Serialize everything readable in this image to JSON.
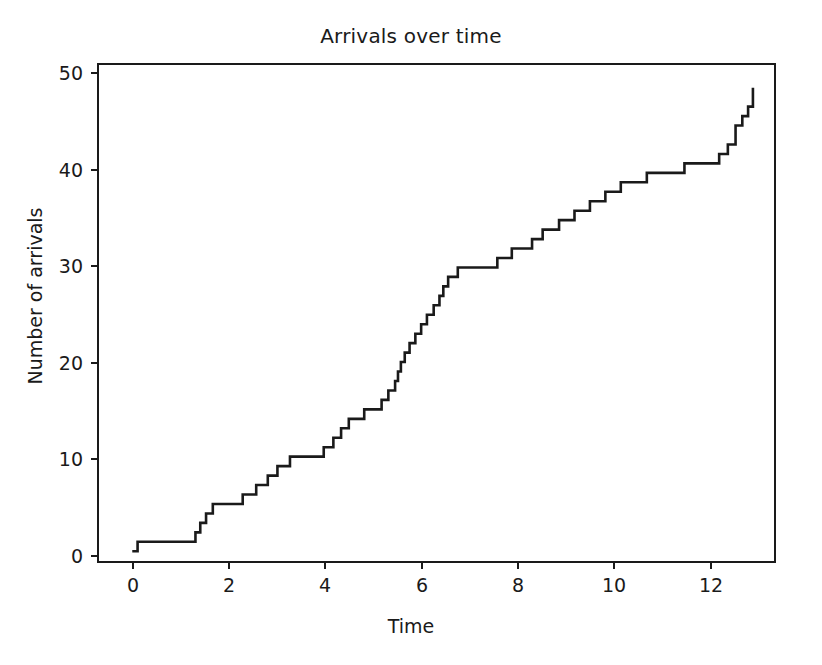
{
  "figure": {
    "width": 822,
    "height": 665,
    "background": "#ffffff",
    "line_color": "#1a1a1a",
    "axis_color": "#1a1a1a"
  },
  "chart_data": {
    "type": "line",
    "drawstyle": "steps-post",
    "title": "Arrivals over time",
    "xlabel": "Time",
    "ylabel": "Number of arrivals",
    "grid": false,
    "legend": null,
    "xlim": [
      -0.64,
      13.44
    ],
    "ylim": [
      -1.45,
      51.4
    ],
    "xticks": [
      0,
      2,
      4,
      6,
      8,
      10,
      12
    ],
    "xticklabels": [
      "0",
      "2",
      "4",
      "6",
      "8",
      "10",
      "12"
    ],
    "yticks": [
      0,
      10,
      20,
      30,
      40,
      50
    ],
    "yticklabels": [
      "0",
      "10",
      "20",
      "30",
      "40",
      "50"
    ],
    "series_name": "cumulative arrivals",
    "x": [
      0.05,
      0.16,
      1.36,
      1.46,
      1.58,
      1.72,
      1.86,
      2.34,
      2.62,
      2.86,
      3.06,
      3.32,
      3.44,
      4.02,
      4.22,
      4.38,
      4.54,
      4.72,
      4.86,
      5.04,
      5.22,
      5.36,
      5.5,
      5.56,
      5.62,
      5.7,
      5.8,
      5.92,
      6.04,
      6.16,
      6.3,
      6.42,
      6.5,
      6.6,
      6.7,
      6.8,
      6.88,
      7.62,
      7.76,
      7.92,
      8.34,
      8.56,
      8.9,
      9.22,
      9.54,
      9.86,
      10.18,
      10.44,
      10.72,
      11.5,
      12.22,
      12.4,
      12.56,
      12.7,
      12.82,
      12.92
    ],
    "y": [
      0,
      1,
      2,
      3,
      4,
      5,
      5,
      6,
      7,
      8,
      9,
      10,
      10,
      11,
      12,
      13,
      14,
      14,
      15,
      15,
      16,
      17,
      18,
      19,
      20,
      21,
      22,
      23,
      24,
      25,
      26,
      27,
      28,
      29,
      29,
      30,
      30,
      31,
      31,
      32,
      33,
      34,
      35,
      36,
      37,
      38,
      39,
      39,
      40,
      41,
      42,
      43,
      45,
      46,
      47,
      49
    ],
    "n_points": 56,
    "y_start": 0,
    "y_end": 49,
    "x_start": 0.05,
    "x_end": 12.92
  }
}
